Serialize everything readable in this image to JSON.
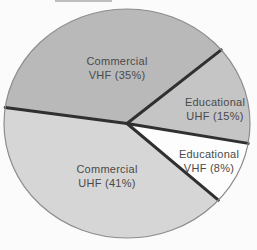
{
  "figure": {
    "background": "#fbfbfb"
  },
  "chart_data": {
    "type": "pie",
    "title": "",
    "categories": [
      "Commercial VHF",
      "Educational UHF",
      "Educational VHF",
      "Commercial UHF"
    ],
    "values": [
      35,
      15,
      8,
      41
    ],
    "unit": "percent",
    "legend": "none - labels printed on slices",
    "slices": [
      {
        "id": "commercial-vhf",
        "label_line1": "Commercial",
        "label_line2": "VHF (35%)",
        "value_pct": 35,
        "color": "#b9b9b9",
        "start_deg": 172,
        "end_deg": 40,
        "label_cx": 117,
        "label_cy": 68
      },
      {
        "id": "educational-uhf",
        "label_line1": "Educational",
        "label_line2": "UHF (15%)",
        "value_pct": 15,
        "color": "#c5c5c5",
        "start_deg": 40,
        "end_deg": -10,
        "label_cx": 215,
        "label_cy": 109
      },
      {
        "id": "educational-vhf",
        "label_line1": "Educational",
        "label_line2": "VHF (8%)",
        "value_pct": 8,
        "color": "#fdfdfd",
        "start_deg": -10,
        "end_deg": -42,
        "label_cx": 209,
        "label_cy": 161
      },
      {
        "id": "commercial-uhf",
        "label_line1": "Commercial",
        "label_line2": "UHF (41%)",
        "value_pct": 41,
        "color": "#d6d6d6",
        "start_deg": -42,
        "end_deg": -188,
        "label_cx": 107,
        "label_cy": 176
      }
    ],
    "geometry": {
      "cx": 127,
      "cy": 123.5,
      "rx": 123,
      "ry": 114.5
    },
    "styles": {
      "outline_color": "#8d8d8d",
      "outline_width": 1.2,
      "divider_color": "#303030",
      "divider_width": 3,
      "text_color": "#4a4a4a"
    }
  },
  "artifacts": {
    "top_crop_mark": {
      "x1": 55,
      "x2": 112,
      "y": 1,
      "color": "#a8a8a8",
      "width": 1.5
    }
  }
}
